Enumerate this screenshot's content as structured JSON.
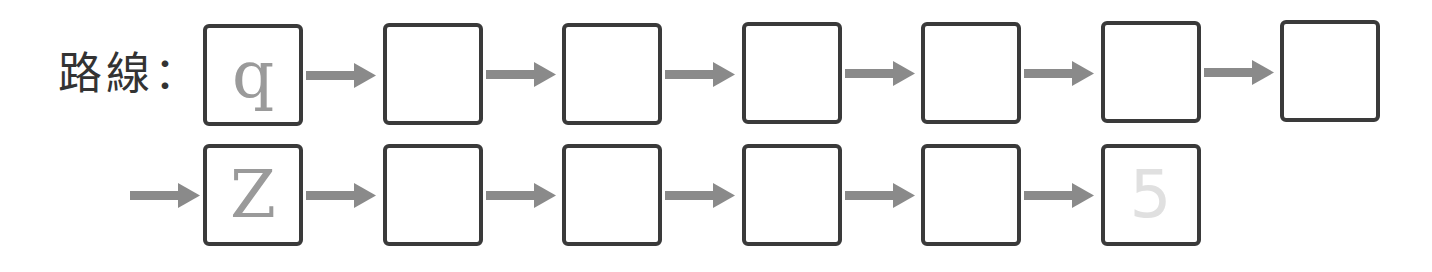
{
  "label": "路線：",
  "colors": {
    "box_border": "#3a3a3a",
    "arrow": "#8a8a8a",
    "given_letter": "#9a9a9a",
    "faint_letter": "#e0e0e0"
  },
  "rows": [
    {
      "lead_arrow": false,
      "boxes": [
        {
          "value": "q",
          "style": "given"
        },
        {
          "value": "",
          "style": "empty"
        },
        {
          "value": "",
          "style": "empty"
        },
        {
          "value": "",
          "style": "empty"
        },
        {
          "value": "",
          "style": "empty"
        },
        {
          "value": "",
          "style": "empty"
        },
        {
          "value": "",
          "style": "empty"
        }
      ]
    },
    {
      "lead_arrow": true,
      "boxes": [
        {
          "value": "Z",
          "style": "given"
        },
        {
          "value": "",
          "style": "empty"
        },
        {
          "value": "",
          "style": "empty"
        },
        {
          "value": "",
          "style": "empty"
        },
        {
          "value": "",
          "style": "empty"
        },
        {
          "value": "5",
          "style": "faint"
        }
      ]
    }
  ]
}
